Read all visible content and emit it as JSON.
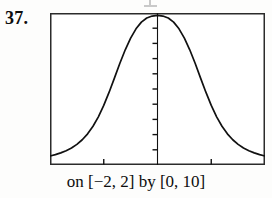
{
  "figure": {
    "problem_number": "37.",
    "caption": "on [−2, 2] by [0, 10]",
    "ink_color": "#111111",
    "paper_color": "#fdfdfc"
  },
  "chart_data": {
    "type": "line",
    "title": "",
    "xlabel": "",
    "ylabel": "",
    "xlim": [
      -2,
      2
    ],
    "ylim": [
      0,
      10
    ],
    "grid": false,
    "legend": null,
    "axis_style": "calculator-window",
    "y_axis_position": 0,
    "x_axis_ticks": [
      -1,
      0,
      1
    ],
    "y_axis_ticks": [
      1,
      2,
      3,
      4,
      5,
      6,
      7,
      8,
      9
    ],
    "series": [
      {
        "name": "bell curve",
        "x": [
          -2.0,
          -1.9,
          -1.8,
          -1.7,
          -1.6,
          -1.5,
          -1.4,
          -1.3,
          -1.2,
          -1.1,
          -1.0,
          -0.9,
          -0.8,
          -0.7,
          -0.6,
          -0.5,
          -0.4,
          -0.3,
          -0.2,
          -0.1,
          0.0,
          0.1,
          0.2,
          0.3,
          0.4,
          0.5,
          0.6,
          0.7,
          0.8,
          0.9,
          1.0,
          1.1,
          1.2,
          1.3,
          1.4,
          1.5,
          1.6,
          1.7,
          1.8,
          1.9,
          2.0
        ],
        "y": [
          0.59,
          0.68,
          0.8,
          0.94,
          1.12,
          1.36,
          1.66,
          2.05,
          2.55,
          3.17,
          3.92,
          4.79,
          5.73,
          6.69,
          7.58,
          8.35,
          8.96,
          9.4,
          9.67,
          9.8,
          9.84,
          9.8,
          9.67,
          9.4,
          8.96,
          8.35,
          7.58,
          6.69,
          5.73,
          4.79,
          3.92,
          3.17,
          2.55,
          2.05,
          1.66,
          1.36,
          1.12,
          0.94,
          0.8,
          0.68,
          0.59
        ]
      }
    ]
  }
}
